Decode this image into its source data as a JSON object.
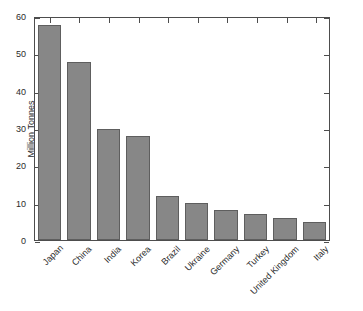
{
  "chart_data": {
    "type": "bar",
    "title": "",
    "subtitle": "",
    "xlabel": "",
    "ylabel": "Million Tonnes",
    "categories": [
      "Japan",
      "China",
      "India",
      "Korea",
      "Brazil",
      "Ukraine",
      "Germany",
      "Turkey",
      "United Kingdom",
      "Italy"
    ],
    "values": [
      58,
      48,
      30,
      28,
      12,
      10,
      8,
      7,
      6,
      5
    ],
    "ylim": [
      0,
      60
    ],
    "yticks": [
      0,
      10,
      20,
      30,
      40,
      50,
      60
    ],
    "ytick_labels": [
      "0",
      "10",
      "20",
      "30",
      "40",
      "50",
      "60"
    ],
    "grid": false,
    "legend": null,
    "series": [
      {
        "name": "Million Tonnes",
        "values": [
          58,
          48,
          30,
          28,
          12,
          10,
          8,
          7,
          6,
          5
        ]
      }
    ],
    "xtick_label_rotation": -45
  },
  "style": {
    "bar_fill": "#878787",
    "bar_edge": "#5e5e5e",
    "axis_color": "#4d4d4d",
    "text_color": "#2b2b2b",
    "background": "#ffffff"
  }
}
